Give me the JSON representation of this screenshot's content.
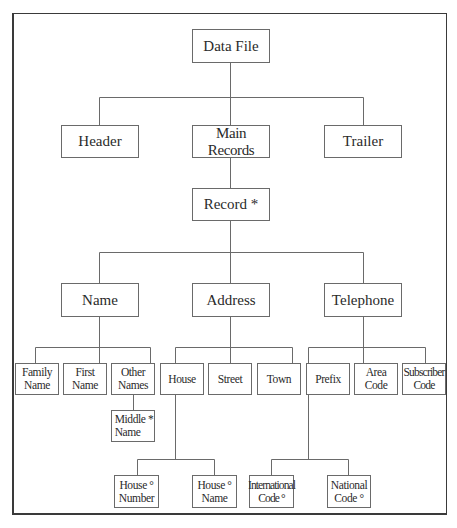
{
  "diagram": {
    "type": "Jackson structure diagram",
    "nodes": {
      "data_file": {
        "label": "Data File"
      },
      "header": {
        "label": "Header"
      },
      "main_records": {
        "label": "Main Records"
      },
      "trailer": {
        "label": "Trailer"
      },
      "record": {
        "label": "Record *"
      },
      "name": {
        "label": "Name"
      },
      "address": {
        "label": "Address"
      },
      "telephone": {
        "label": "Telephone"
      },
      "family_name": {
        "line1": "Family",
        "line2": "Name"
      },
      "first_name": {
        "line1": "First",
        "line2": "Name"
      },
      "other_names": {
        "line1": "Other",
        "line2": "Names"
      },
      "middle_name": {
        "line1": "Middle *",
        "line2": "Name"
      },
      "house": {
        "label": "House"
      },
      "street": {
        "label": "Street"
      },
      "town": {
        "label": "Town"
      },
      "prefix": {
        "label": "Prefix"
      },
      "area_code": {
        "line1": "Area",
        "line2": "Code"
      },
      "subscriber_code": {
        "line1": "Subscriber",
        "line2": "Code"
      },
      "house_number": {
        "line1": "House °",
        "line2": "Number"
      },
      "house_name": {
        "line1": "House °",
        "line2": "Name"
      },
      "international_code": {
        "line1": "International",
        "line2": "Code °"
      },
      "national_code": {
        "line1": "National",
        "line2": "Code °"
      }
    },
    "edges": [
      [
        "Data File",
        "Header"
      ],
      [
        "Data File",
        "Main Records"
      ],
      [
        "Data File",
        "Trailer"
      ],
      [
        "Main Records",
        "Record *"
      ],
      [
        "Record *",
        "Name"
      ],
      [
        "Record *",
        "Address"
      ],
      [
        "Record *",
        "Telephone"
      ],
      [
        "Name",
        "Family Name"
      ],
      [
        "Name",
        "First Name"
      ],
      [
        "Name",
        "Other Names"
      ],
      [
        "Other Names",
        "Middle * Name"
      ],
      [
        "Address",
        "House"
      ],
      [
        "Address",
        "Street"
      ],
      [
        "Address",
        "Town"
      ],
      [
        "House",
        "House ° Number"
      ],
      [
        "House",
        "House ° Name"
      ],
      [
        "Telephone",
        "Prefix"
      ],
      [
        "Telephone",
        "Area Code"
      ],
      [
        "Telephone",
        "Subscriber Code"
      ],
      [
        "Prefix",
        "International Code °"
      ],
      [
        "Prefix",
        "National Code °"
      ]
    ],
    "colors": {
      "line": "#6a6a6a",
      "frame": "#3a3a3a",
      "background": "#ffffff"
    }
  }
}
